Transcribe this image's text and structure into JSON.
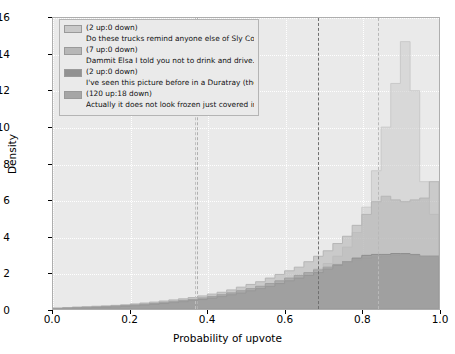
{
  "chart_data": {
    "type": "bar",
    "chart_subtype": "overlapping-step-histogram",
    "title": "",
    "xlabel": "Probability of upvote",
    "ylabel": "Density",
    "xlim": [
      0.0,
      1.0
    ],
    "ylim": [
      0,
      16
    ],
    "xticks": [
      "0.0",
      "0.2",
      "0.4",
      "0.6",
      "0.8",
      "1.0"
    ],
    "xtick_values": [
      0.0,
      0.2,
      0.4,
      0.6,
      0.8,
      1.0
    ],
    "yticks": [
      "0",
      "2",
      "4",
      "6",
      "8",
      "10",
      "12",
      "14",
      "16"
    ],
    "ytick_values": [
      0,
      2,
      4,
      6,
      8,
      10,
      12,
      14,
      16
    ],
    "grid": true,
    "grid_color": "#ffffff",
    "axes_facecolor": "#eaeaea",
    "legend_position": "upper left",
    "bin_edges": [
      0.0,
      0.025,
      0.05,
      0.075,
      0.1,
      0.125,
      0.15,
      0.175,
      0.2,
      0.225,
      0.25,
      0.275,
      0.3,
      0.325,
      0.35,
      0.375,
      0.4,
      0.425,
      0.45,
      0.475,
      0.5,
      0.525,
      0.55,
      0.575,
      0.6,
      0.625,
      0.65,
      0.675,
      0.7,
      0.725,
      0.75,
      0.775,
      0.8,
      0.825,
      0.85,
      0.875,
      0.9,
      0.925,
      0.95,
      0.975,
      1.0
    ],
    "series": [
      {
        "name": "Do these trucks remind anyone else of Sly Cooper?...",
        "votes": "(2 up:0 down)",
        "color": "#c8c8c8",
        "alpha": 0.55,
        "vline": 0.365,
        "values": [
          0.05,
          0.08,
          0.1,
          0.12,
          0.14,
          0.16,
          0.18,
          0.2,
          0.25,
          0.3,
          0.35,
          0.4,
          0.45,
          0.5,
          0.55,
          0.62,
          0.7,
          0.8,
          0.9,
          1.0,
          1.1,
          1.2,
          1.35,
          1.5,
          1.65,
          1.8,
          2.0,
          2.2,
          2.5,
          2.9,
          3.4,
          4.2,
          5.6,
          7.6,
          10.0,
          12.4,
          14.7,
          12.0,
          7.0,
          5.2
        ]
      },
      {
        "name": "Dammit Elsa I told you not to drink and drive...",
        "votes": "(7 up:0 down)",
        "color": "#b4b4b4",
        "alpha": 0.6,
        "vline": 0.372,
        "values": [
          0.05,
          0.08,
          0.1,
          0.12,
          0.15,
          0.17,
          0.2,
          0.23,
          0.28,
          0.33,
          0.38,
          0.44,
          0.5,
          0.56,
          0.63,
          0.72,
          0.82,
          0.92,
          1.05,
          1.2,
          1.35,
          1.5,
          1.7,
          1.9,
          2.1,
          2.3,
          2.6,
          2.9,
          3.2,
          3.6,
          4.0,
          4.6,
          5.2,
          5.9,
          6.2,
          6.0,
          5.9,
          6.0,
          6.1,
          7.0
        ]
      },
      {
        "name": "I've seen this picture before in a Duratray (the d....",
        "votes": "(2 up:0 down)",
        "color": "#8c8c8c",
        "alpha": 0.6,
        "vline": 0.682,
        "values": [
          0.02,
          0.03,
          0.05,
          0.06,
          0.08,
          0.1,
          0.12,
          0.15,
          0.18,
          0.22,
          0.26,
          0.3,
          0.35,
          0.4,
          0.46,
          0.52,
          0.6,
          0.68,
          0.78,
          0.88,
          1.0,
          1.12,
          1.25,
          1.4,
          1.55,
          1.7,
          1.85,
          2.0,
          2.2,
          2.4,
          2.6,
          2.8,
          2.95,
          3.0,
          3.0,
          3.05,
          3.05,
          3.0,
          2.9,
          2.9
        ]
      },
      {
        "name": "Actually it does not look frozen just covered in a...",
        "votes": "(120 up:18 down)",
        "color": "#9e9e9e",
        "alpha": 0.55,
        "vline": 0.838,
        "values": [
          0.03,
          0.05,
          0.07,
          0.09,
          0.11,
          0.13,
          0.16,
          0.19,
          0.22,
          0.26,
          0.3,
          0.35,
          0.4,
          0.46,
          0.52,
          0.6,
          0.68,
          0.78,
          0.88,
          1.0,
          1.12,
          1.25,
          1.4,
          1.55,
          1.7,
          1.85,
          2.0,
          2.15,
          2.3,
          2.45,
          2.6,
          2.7,
          2.8,
          2.85,
          2.9,
          2.95,
          3.0,
          2.95,
          2.9,
          2.9
        ]
      }
    ],
    "vlines": [
      {
        "x": 0.365,
        "color": "#c0c0c0",
        "style": "dashed"
      },
      {
        "x": 0.372,
        "color": "#b0b0b0",
        "style": "dashed"
      },
      {
        "x": 0.682,
        "color": "#707070",
        "style": "dashed"
      },
      {
        "x": 0.838,
        "color": "#b8b8b8",
        "style": "dashed"
      }
    ]
  },
  "legend": {
    "entries": [
      {
        "votes": "(2 up:0 down)",
        "text": "Do these trucks remind anyone else of Sly Cooper?...",
        "swatch": "#c9c9c9"
      },
      {
        "votes": "(7 up:0 down)",
        "text": "Dammit Elsa I told you not to drink and drive...",
        "swatch": "#b7b7b7"
      },
      {
        "votes": "(2 up:0 down)",
        "text": "I've seen this picture before in a Duratray (the d....",
        "swatch": "#919191"
      },
      {
        "votes": "(120 up:18 down)",
        "text": "Actually it does not look frozen just covered in a...",
        "swatch": "#a6a6a6"
      }
    ]
  }
}
